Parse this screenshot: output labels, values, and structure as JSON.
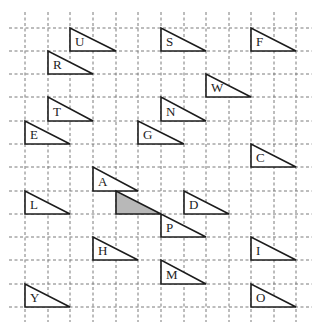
{
  "figure": {
    "width": 318,
    "height": 325,
    "grid": {
      "columns_x": [
        25,
        48,
        70,
        93,
        116,
        138,
        161,
        184,
        206,
        229,
        251,
        274,
        296
      ],
      "rows_y": [
        28,
        51,
        74,
        97,
        121,
        144,
        167,
        191,
        214,
        237,
        260,
        284,
        307
      ],
      "h_extent": [
        9,
        312
      ],
      "v_extent": [
        12,
        322
      ],
      "style": "dashed",
      "color": "#7a7a7a"
    },
    "triangle_shape": {
      "description": "right triangle, right angle at bottom-left, 2 cells wide, 1 cell tall",
      "width_cells": 2,
      "height_cells": 1
    },
    "colors": {
      "outline": "#1c1c1c",
      "fill": "#ffffff",
      "shaded_fill": "#b8b8b8",
      "label": "#222222"
    },
    "triangles": [
      {
        "label": "U",
        "col": 2,
        "row": 0,
        "shaded": false
      },
      {
        "label": "S",
        "col": 6,
        "row": 0,
        "shaded": false
      },
      {
        "label": "F",
        "col": 10,
        "row": 0,
        "shaded": false
      },
      {
        "label": "R",
        "col": 1,
        "row": 1,
        "shaded": false
      },
      {
        "label": "W",
        "col": 8,
        "row": 2,
        "shaded": false
      },
      {
        "label": "T",
        "col": 1,
        "row": 3,
        "shaded": false
      },
      {
        "label": "N",
        "col": 6,
        "row": 3,
        "shaded": false
      },
      {
        "label": "E",
        "col": 0,
        "row": 4,
        "shaded": false
      },
      {
        "label": "G",
        "col": 5,
        "row": 4,
        "shaded": false
      },
      {
        "label": "C",
        "col": 10,
        "row": 5,
        "shaded": false
      },
      {
        "label": "A",
        "col": 3,
        "row": 6,
        "shaded": false
      },
      {
        "label": "",
        "col": 4,
        "row": 7,
        "shaded": true
      },
      {
        "label": "L",
        "col": 0,
        "row": 7,
        "shaded": false
      },
      {
        "label": "D",
        "col": 7,
        "row": 7,
        "shaded": false
      },
      {
        "label": "P",
        "col": 6,
        "row": 8,
        "shaded": false
      },
      {
        "label": "H",
        "col": 3,
        "row": 9,
        "shaded": false
      },
      {
        "label": "I",
        "col": 10,
        "row": 9,
        "shaded": false
      },
      {
        "label": "M",
        "col": 6,
        "row": 10,
        "shaded": false
      },
      {
        "label": "Y",
        "col": 0,
        "row": 11,
        "shaded": false
      },
      {
        "label": "O",
        "col": 10,
        "row": 11,
        "shaded": false
      }
    ]
  }
}
